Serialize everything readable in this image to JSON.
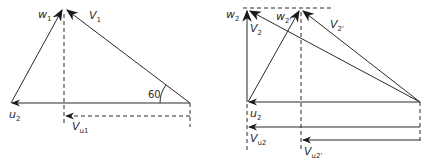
{
  "figure": {
    "left_diagram": {
      "name": "inlet-velocity-triangle",
      "labels": {
        "w": "w",
        "w_sub": "1",
        "v": "V",
        "v_sub": "1",
        "u": "u",
        "u_sub": "2",
        "vu": "V",
        "vu_sub": "u1",
        "angle": "60"
      }
    },
    "right_diagram": {
      "name": "outlet-velocity-triangles",
      "labels": {
        "w2": "w",
        "w2_sub": "2",
        "v2": "V",
        "v2_sub": "2",
        "w2p": "w",
        "w2p_sub": "2'",
        "v2p": "V",
        "v2p_sub": "2'",
        "u": "u",
        "u_sub": "2",
        "vu2": "V",
        "vu2_sub": "u2",
        "vu2p": "V",
        "vu2p_sub": "u2'"
      }
    },
    "colors": {
      "line": "#2a2a2a",
      "background": "#ffffff"
    }
  }
}
